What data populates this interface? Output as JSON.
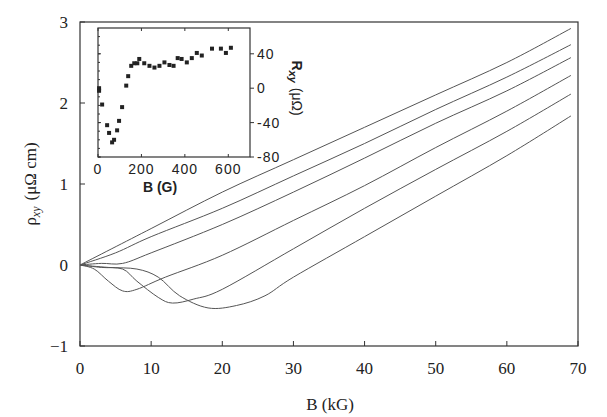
{
  "chart_data": [
    {
      "type": "line",
      "title": "",
      "xlabel": "B (kG)",
      "ylabel": "ρxy (μΩ cm)",
      "xlim": [
        0,
        70
      ],
      "ylim": [
        -1,
        3
      ],
      "xticks": [
        0,
        10,
        20,
        30,
        40,
        50,
        60,
        70
      ],
      "yticks": [
        -1,
        0,
        1,
        2,
        3
      ],
      "grid": false,
      "legend": null,
      "series": [
        {
          "name": "curve 1",
          "x": [
            0,
            10,
            20,
            30,
            40,
            50,
            60,
            69
          ],
          "y": [
            0,
            0.45,
            0.9,
            1.3,
            1.7,
            2.1,
            2.5,
            2.92
          ]
        },
        {
          "name": "curve 2",
          "x": [
            0,
            5,
            10,
            20,
            30,
            40,
            50,
            60,
            69
          ],
          "y": [
            0,
            0.15,
            0.35,
            0.7,
            1.1,
            1.5,
            1.92,
            2.32,
            2.72
          ]
        },
        {
          "name": "curve 3",
          "x": [
            0,
            3,
            6,
            10,
            20,
            30,
            40,
            50,
            60,
            69
          ],
          "y": [
            0,
            0.02,
            0.02,
            0.15,
            0.5,
            0.9,
            1.32,
            1.75,
            2.15,
            2.56
          ]
        },
        {
          "name": "curve 4",
          "x": [
            0,
            2,
            4,
            6,
            8,
            12,
            20,
            30,
            40,
            50,
            60,
            69
          ],
          "y": [
            0,
            -0.05,
            -0.2,
            -0.32,
            -0.3,
            -0.15,
            0.12,
            0.55,
            0.98,
            1.45,
            1.9,
            2.34
          ]
        },
        {
          "name": "curve 5",
          "x": [
            0,
            3,
            6,
            8,
            11,
            13,
            16,
            20,
            30,
            40,
            50,
            60,
            69
          ],
          "y": [
            0,
            -0.03,
            -0.05,
            -0.2,
            -0.4,
            -0.47,
            -0.42,
            -0.3,
            0.2,
            0.7,
            1.18,
            1.65,
            2.11
          ]
        },
        {
          "name": "curve 6",
          "x": [
            0,
            4,
            8,
            11,
            14,
            18,
            22,
            26,
            30,
            40,
            50,
            60,
            69
          ],
          "y": [
            0,
            -0.03,
            -0.05,
            -0.15,
            -0.38,
            -0.53,
            -0.5,
            -0.38,
            -0.15,
            0.35,
            0.85,
            1.35,
            1.84
          ]
        }
      ]
    },
    {
      "type": "scatter",
      "title": "inset",
      "xlabel": "B (G)",
      "ylabel": "Rxy (μΩ)",
      "xlim": [
        0,
        700
      ],
      "ylim": [
        -80,
        70
      ],
      "xticks": [
        0,
        200,
        400,
        600
      ],
      "yticks": [
        -80,
        -40,
        0,
        40
      ],
      "y_axis_side": "right",
      "series": [
        {
          "name": "Rxy",
          "x": [
            5,
            5,
            19,
            42,
            51,
            65,
            74,
            88,
            97,
            111,
            130,
            139,
            153,
            167,
            181,
            190,
            213,
            237,
            260,
            283,
            306,
            329,
            348,
            367,
            385,
            409,
            432,
            455,
            478,
            525,
            566,
            589,
            612
          ],
          "y": [
            0,
            -3,
            -19,
            -43,
            -52,
            -63,
            -60,
            -49,
            -38,
            -22,
            3,
            14,
            26,
            29,
            29,
            34,
            29,
            26,
            24,
            26,
            30,
            27,
            26,
            35,
            34,
            30,
            35,
            41,
            38,
            46,
            46,
            41,
            47
          ]
        }
      ]
    }
  ],
  "main": {
    "xlabel": "B (kG)",
    "ylabel_main": "ρ",
    "ylabel_sub": "xy",
    "ylabel_units": "(μΩ cm)",
    "xtick_labels": [
      "0",
      "10",
      "20",
      "30",
      "40",
      "50",
      "60",
      "70"
    ],
    "ytick_labels": [
      "-1",
      "0",
      "1",
      "2",
      "3"
    ]
  },
  "inset": {
    "xlabel": "B (G)",
    "ylabel_main": "R",
    "ylabel_sub": "xy",
    "ylabel_units": "(μΩ)",
    "xtick_labels": [
      "0",
      "200",
      "400",
      "600"
    ],
    "ytick_labels": [
      "-80",
      "-40",
      "0",
      "40"
    ]
  }
}
